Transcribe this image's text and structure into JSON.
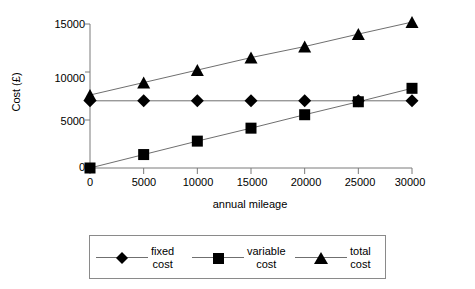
{
  "chart_data": {
    "type": "line",
    "title": "",
    "xlabel": "annual mileage",
    "ylabel": "Cost (£)",
    "x": [
      0,
      5000,
      10000,
      15000,
      20000,
      25000,
      30000
    ],
    "xlim": [
      0,
      30000
    ],
    "ylim": [
      0,
      15000
    ],
    "xticks": [
      "0",
      "5000",
      "10000",
      "15000",
      "20000",
      "25000",
      "30000"
    ],
    "yticks": [
      "0",
      "5000",
      "10000",
      "15000"
    ],
    "grid": false,
    "legend_position": "bottom",
    "series": [
      {
        "name": "fixed cost",
        "legend_line1": "fixed",
        "legend_line2": "cost",
        "marker": "diamond",
        "color": "#000000",
        "values": [
          7000,
          7000,
          7000,
          7000,
          7000,
          7000,
          7000
        ]
      },
      {
        "name": "variable cost",
        "legend_line1": "variable",
        "legend_line2": "cost",
        "marker": "square",
        "color": "#000000",
        "values": [
          0,
          1400,
          2800,
          4150,
          5550,
          6900,
          8300
        ]
      },
      {
        "name": "total cost",
        "legend_line1": "total",
        "legend_line2": "cost",
        "marker": "triangle",
        "color": "#000000",
        "values": [
          7600,
          8900,
          10200,
          11500,
          12650,
          13950,
          15200
        ]
      }
    ]
  },
  "axes": {
    "ylabel": "Cost (£)",
    "xlabel": "annual mileage",
    "ytick_labels": [
      "15000",
      "10000",
      "5000",
      "0"
    ],
    "xtick_labels": [
      "0",
      "5000",
      "10000",
      "15000",
      "20000",
      "25000",
      "30000"
    ]
  },
  "legend": {
    "entries": [
      {
        "line1": "fixed",
        "line2": "cost",
        "marker": "diamond-marker-icon"
      },
      {
        "line1": "variable",
        "line2": "cost",
        "marker": "square-marker-icon"
      },
      {
        "line1": "total",
        "line2": "cost",
        "marker": "triangle-marker-icon"
      }
    ]
  }
}
